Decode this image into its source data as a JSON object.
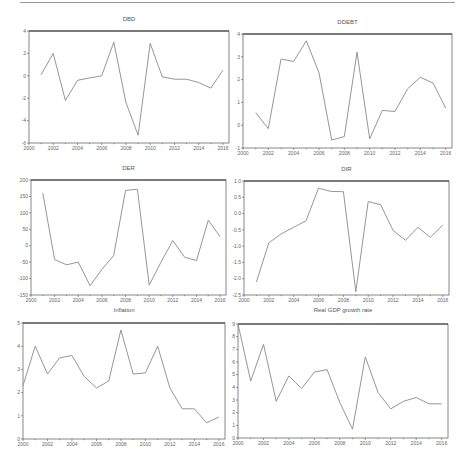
{
  "page": {
    "header_rule": true
  },
  "chart_data": [
    {
      "id": "dbd",
      "type": "line",
      "title": "DBD",
      "xlabel": "",
      "ylabel": "",
      "x": [
        2001,
        2002,
        2003,
        2004,
        2005,
        2006,
        2007,
        2008,
        2009,
        2010,
        2011,
        2012,
        2013,
        2014,
        2015,
        2016
      ],
      "values": [
        0.1,
        2.0,
        -2.2,
        -0.4,
        -0.2,
        0.0,
        3.0,
        -2.4,
        -5.3,
        2.9,
        -0.1,
        -0.3,
        -0.3,
        -0.6,
        -1.1,
        0.5
      ],
      "xlim": [
        2000,
        2016.5
      ],
      "ylim": [
        -6,
        4
      ],
      "xticks": [
        2000,
        2002,
        2004,
        2006,
        2008,
        2010,
        2012,
        2014,
        2016
      ],
      "yticks": [
        -6,
        -4,
        -2,
        0,
        2,
        4
      ],
      "ytick_labels": [
        "-6",
        "-4",
        "-2",
        "0",
        "2",
        "4"
      ],
      "grid": false,
      "legend": false,
      "frame": {
        "left": 29,
        "top": 31,
        "right": 229,
        "bottom": 143
      }
    },
    {
      "id": "ddebt",
      "type": "line",
      "title": "DDEBT",
      "xlabel": "",
      "ylabel": "",
      "x": [
        2001,
        2002,
        2003,
        2004,
        2005,
        2006,
        2007,
        2008,
        2009,
        2010,
        2011,
        2012,
        2013,
        2014,
        2015,
        2016
      ],
      "values": [
        0.55,
        -0.15,
        2.9,
        2.8,
        3.7,
        2.3,
        -0.65,
        -0.5,
        3.2,
        -0.6,
        0.65,
        0.6,
        1.6,
        2.1,
        1.85,
        0.75
      ],
      "xlim": [
        2000,
        2016.5
      ],
      "ylim": [
        -1,
        4
      ],
      "xticks": [
        2000,
        2002,
        2004,
        2006,
        2008,
        2010,
        2012,
        2014,
        2016
      ],
      "yticks": [
        -1,
        0,
        1,
        2,
        3,
        4
      ],
      "ytick_labels": [
        "-1",
        "0",
        "1",
        "2",
        "3",
        "4"
      ],
      "grid": false,
      "legend": false,
      "frame": {
        "left": 243,
        "top": 34,
        "right": 452,
        "bottom": 148
      }
    },
    {
      "id": "der",
      "type": "line",
      "title": "DER",
      "xlabel": "",
      "ylabel": "",
      "x": [
        2001,
        2002,
        2003,
        2004,
        2005,
        2006,
        2007,
        2008,
        2009,
        2010,
        2011,
        2012,
        2013,
        2014,
        2015,
        2016
      ],
      "values": [
        160,
        -42,
        -58,
        -50,
        -122,
        -72,
        -30,
        168,
        172,
        -120,
        -50,
        16,
        -35,
        -45,
        78,
        27
      ],
      "xlim": [
        2000,
        2016.5
      ],
      "ylim": [
        -150,
        200
      ],
      "xticks": [
        2000,
        2002,
        2004,
        2006,
        2008,
        2010,
        2012,
        2014,
        2016
      ],
      "yticks": [
        -150,
        -100,
        -50,
        0,
        50,
        100,
        150,
        200
      ],
      "ytick_labels": [
        "-150",
        "-100",
        "-50",
        "0",
        "50",
        "100",
        "150",
        "200"
      ],
      "grid": false,
      "legend": false,
      "frame": {
        "left": 31,
        "top": 180,
        "right": 226,
        "bottom": 295
      }
    },
    {
      "id": "dir",
      "type": "line",
      "title": "DIR",
      "xlabel": "",
      "ylabel": "",
      "x": [
        2001,
        2002,
        2003,
        2004,
        2005,
        2006,
        2007,
        2008,
        2009,
        2010,
        2011,
        2012,
        2013,
        2014,
        2015,
        2016
      ],
      "values": [
        -2.1,
        -0.9,
        -0.62,
        -0.42,
        -0.22,
        0.78,
        0.68,
        0.67,
        -2.4,
        0.37,
        0.27,
        -0.52,
        -0.82,
        -0.42,
        -0.73,
        -0.35
      ],
      "xlim": [
        2000,
        2016.5
      ],
      "ylim": [
        -2.5,
        1.0
      ],
      "xticks": [
        2000,
        2002,
        2004,
        2006,
        2008,
        2010,
        2012,
        2014,
        2016
      ],
      "yticks": [
        -2.5,
        -2.0,
        -1.5,
        -1.0,
        -0.5,
        0.0,
        0.5,
        1.0
      ],
      "ytick_labels": [
        "-2.5",
        "-2.0",
        "-1.5",
        "-1.0",
        "-0.5",
        "0.0",
        "0.5",
        "1.0"
      ],
      "grid": false,
      "legend": false,
      "frame": {
        "left": 244,
        "top": 181,
        "right": 449,
        "bottom": 295
      }
    },
    {
      "id": "inflation",
      "type": "line",
      "title": "Inflation",
      "xlabel": "",
      "ylabel": "",
      "x": [
        2000,
        2001,
        2002,
        2003,
        2004,
        2005,
        2006,
        2007,
        2008,
        2009,
        2010,
        2011,
        2012,
        2013,
        2014,
        2015,
        2016
      ],
      "values": [
        2.3,
        4.0,
        2.8,
        3.5,
        3.6,
        2.7,
        2.2,
        2.5,
        4.7,
        2.8,
        2.85,
        4.0,
        2.2,
        1.3,
        1.3,
        0.7,
        0.95
      ],
      "xlim": [
        2000,
        2016.5
      ],
      "ylim": [
        0,
        5
      ],
      "xticks": [
        2000,
        2002,
        2004,
        2006,
        2008,
        2010,
        2012,
        2014,
        2016
      ],
      "yticks": [
        0,
        1,
        2,
        3,
        4,
        5
      ],
      "ytick_labels": [
        "0",
        "1",
        "2",
        "3",
        "4",
        "5"
      ],
      "grid": false,
      "legend": false,
      "frame": {
        "left": 23,
        "top": 323,
        "right": 225,
        "bottom": 439
      }
    },
    {
      "id": "gdp",
      "type": "line",
      "title": "Real GDP growth rate",
      "xlabel": "",
      "ylabel": "",
      "x": [
        2000,
        2001,
        2002,
        2003,
        2004,
        2005,
        2006,
        2007,
        2008,
        2009,
        2010,
        2011,
        2012,
        2013,
        2014,
        2015,
        2016
      ],
      "values": [
        9.0,
        4.5,
        7.4,
        2.9,
        4.9,
        3.9,
        5.2,
        5.4,
        2.8,
        0.7,
        6.4,
        3.6,
        2.3,
        2.9,
        3.2,
        2.7,
        2.7
      ],
      "xlim": [
        2000,
        2016.5
      ],
      "ylim": [
        0,
        9
      ],
      "xticks": [
        2000,
        2002,
        2004,
        2006,
        2008,
        2010,
        2012,
        2014,
        2016
      ],
      "yticks": [
        0,
        1,
        2,
        3,
        4,
        5,
        6,
        7,
        8,
        9
      ],
      "ytick_labels": [
        "0",
        "1",
        "2",
        "3",
        "4",
        "5",
        "6",
        "7",
        "8",
        "9"
      ],
      "grid": false,
      "legend": false,
      "frame": {
        "left": 238,
        "top": 324,
        "right": 448,
        "bottom": 438
      }
    }
  ],
  "titles": {
    "dbd": "DBD",
    "ddebt": "DDEBT",
    "der": "DER",
    "dir": "DIR",
    "inflation": "Inflation",
    "gdp": "Real GDP growth rate"
  },
  "colors": {
    "line": "#8a8a8a",
    "frame": "#555555",
    "text": "#666666"
  }
}
